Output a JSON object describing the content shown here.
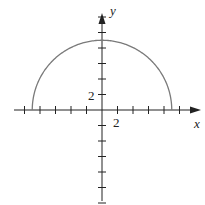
{
  "chart_data": {
    "type": "line",
    "title": "",
    "xlabel": "x",
    "ylabel": "y",
    "function": "y = sqrt(81 - x^2)",
    "x": [
      -9,
      -8,
      -6,
      -4,
      -2,
      0,
      2,
      4,
      6,
      8,
      9
    ],
    "values": [
      0,
      4.12,
      6.71,
      8.06,
      8.77,
      9,
      8.77,
      8.06,
      6.71,
      4.12,
      0
    ],
    "tick_step": 2,
    "x_ticks": [
      -10,
      -8,
      -6,
      -4,
      -2,
      2,
      4,
      6,
      8,
      10
    ],
    "y_ticks": [
      -12,
      -10,
      -8,
      -6,
      -4,
      -2,
      2,
      4,
      6,
      8,
      10,
      12
    ],
    "labeled_ticks": {
      "x": "2",
      "y": "2"
    },
    "xlim": [
      -11.5,
      12.5
    ],
    "ylim": [
      -11.5,
      12.5
    ],
    "grid": false,
    "legend": null
  },
  "labels": {
    "x_axis": "x",
    "y_axis": "y",
    "x_tick_label": "2",
    "y_tick_label": "2"
  },
  "colors": {
    "curve": "#7a7a7a",
    "axes": "#222222"
  }
}
